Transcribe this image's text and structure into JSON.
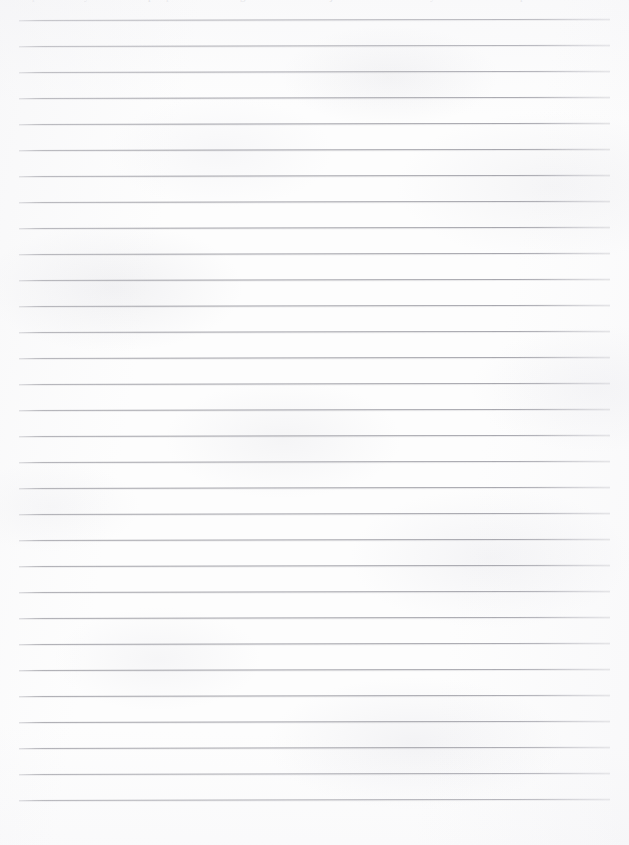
{
  "document": {
    "kind": "scanned-lined-notebook-page",
    "title": "Blank lined notebook page",
    "width": 629,
    "height": 845,
    "background_color": "#fdfdfd",
    "body_text": "",
    "has_visible_text": false,
    "note": "Blank ruled writing page; no written content is visible."
  },
  "paper": {
    "line_color": "#a0a0a7",
    "line_count": 31,
    "line_thickness_px": 1,
    "line_spacing_px": 26,
    "first_line_y": 20,
    "last_line_y": 800,
    "line_left_x": 19,
    "line_right_x": 610,
    "left_margin_px": 19,
    "right_margin_px": 19,
    "bottom_margin_px": 45,
    "skew_degrees": -0.115,
    "has_vertical_margin_rule": false,
    "lines": [
      {
        "index": 1,
        "y": 20,
        "label": "rule-line-1"
      },
      {
        "index": 2,
        "y": 46,
        "label": "rule-line-2"
      },
      {
        "index": 3,
        "y": 72,
        "label": "rule-line-3"
      },
      {
        "index": 4,
        "y": 98,
        "label": "rule-line-4"
      },
      {
        "index": 5,
        "y": 124,
        "label": "rule-line-5"
      },
      {
        "index": 6,
        "y": 150,
        "label": "rule-line-6"
      },
      {
        "index": 7,
        "y": 176,
        "label": "rule-line-7"
      },
      {
        "index": 8,
        "y": 202,
        "label": "rule-line-8"
      },
      {
        "index": 9,
        "y": 228,
        "label": "rule-line-9"
      },
      {
        "index": 10,
        "y": 254,
        "label": "rule-line-10"
      },
      {
        "index": 11,
        "y": 280,
        "label": "rule-line-11"
      },
      {
        "index": 12,
        "y": 306,
        "label": "rule-line-12"
      },
      {
        "index": 13,
        "y": 332,
        "label": "rule-line-13"
      },
      {
        "index": 14,
        "y": 358,
        "label": "rule-line-14"
      },
      {
        "index": 15,
        "y": 384,
        "label": "rule-line-15"
      },
      {
        "index": 16,
        "y": 410,
        "label": "rule-line-16"
      },
      {
        "index": 17,
        "y": 436,
        "label": "rule-line-17"
      },
      {
        "index": 18,
        "y": 462,
        "label": "rule-line-18"
      },
      {
        "index": 19,
        "y": 488,
        "label": "rule-line-19"
      },
      {
        "index": 20,
        "y": 514,
        "label": "rule-line-20"
      },
      {
        "index": 21,
        "y": 540,
        "label": "rule-line-21"
      },
      {
        "index": 22,
        "y": 566,
        "label": "rule-line-22"
      },
      {
        "index": 23,
        "y": 592,
        "label": "rule-line-23"
      },
      {
        "index": 24,
        "y": 618,
        "label": "rule-line-24"
      },
      {
        "index": 25,
        "y": 644,
        "label": "rule-line-25"
      },
      {
        "index": 26,
        "y": 670,
        "label": "rule-line-26"
      },
      {
        "index": 27,
        "y": 696,
        "label": "rule-line-27"
      },
      {
        "index": 28,
        "y": 722,
        "label": "rule-line-28"
      },
      {
        "index": 29,
        "y": 748,
        "label": "rule-line-29"
      },
      {
        "index": 30,
        "y": 774,
        "label": "rule-line-30"
      },
      {
        "index": 31,
        "y": 800,
        "label": "rule-line-31"
      }
    ]
  },
  "top_edge_fragments": {
    "description": "Illegible descender fragments of a line of text cropped off at the top edge of the scan.",
    "legible": false,
    "text": "",
    "marks": [
      {
        "x": 32,
        "glyph": "p"
      },
      {
        "x": 84,
        "glyph": "y"
      },
      {
        "x": 148,
        "glyph": "p"
      },
      {
        "x": 166,
        "glyph": "p"
      },
      {
        "x": 240,
        "glyph": "g"
      },
      {
        "x": 330,
        "glyph": "j"
      },
      {
        "x": 430,
        "glyph": "y"
      },
      {
        "x": 520,
        "glyph": "p"
      }
    ]
  }
}
